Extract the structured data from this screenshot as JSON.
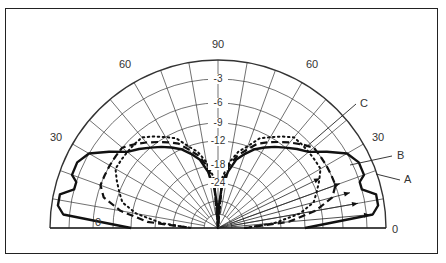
{
  "chart_data": {
    "type": "polar",
    "title": "",
    "subtitle": "",
    "angular_axis": {
      "unit": "degrees (elevation)",
      "range": [
        0,
        180
      ],
      "tick_labels": [
        {
          "angle": 0,
          "label": "0",
          "side": "left"
        },
        {
          "angle": 30,
          "label": "30",
          "side": "left"
        },
        {
          "angle": 60,
          "label": "60",
          "side": "left"
        },
        {
          "angle": 90,
          "label": "90"
        },
        {
          "angle": 60,
          "label": "60",
          "side": "right"
        },
        {
          "angle": 30,
          "label": "30",
          "side": "right"
        },
        {
          "angle": 0,
          "label": "0",
          "side": "right"
        }
      ],
      "gridline_step_deg": 10
    },
    "radial_axis": {
      "unit": "dB",
      "tick_labels": [
        "-3",
        "-6",
        "-9",
        "-12",
        "-18",
        "-24"
      ],
      "tick_values": [
        -3,
        -6,
        -9,
        -12,
        -18,
        -24
      ],
      "range": [
        -40,
        0
      ],
      "grid": true
    },
    "series": [
      {
        "name": "A",
        "style": "solid-thick",
        "angles_deg": [
          0,
          5,
          8,
          12,
          15,
          18,
          20,
          25,
          30,
          35,
          40,
          45,
          50,
          55,
          60,
          65,
          70,
          75,
          80,
          85,
          88,
          90
        ],
        "values_db": [
          -12,
          -2,
          -1,
          -1,
          -3,
          -3,
          -2,
          -2,
          -3,
          -5,
          -7,
          -8,
          -9,
          -10,
          -11,
          -12,
          -14,
          -16,
          -20,
          -26,
          -32,
          -40
        ]
      },
      {
        "name": "B",
        "style": "dashed",
        "angles_deg": [
          0,
          5,
          10,
          15,
          20,
          25,
          30,
          35,
          40,
          45,
          50,
          55,
          60,
          65,
          70,
          75,
          80,
          85,
          90
        ],
        "values_db": [
          -30,
          -16,
          -10,
          -7,
          -6,
          -6,
          -6,
          -6,
          -6,
          -7,
          -8,
          -9,
          -10,
          -11,
          -13,
          -15,
          -18,
          -24,
          -40
        ]
      },
      {
        "name": "C",
        "style": "dotted",
        "angles_deg": [
          0,
          5,
          10,
          15,
          20,
          25,
          30,
          35,
          40,
          45,
          50,
          55,
          60,
          65,
          70,
          75,
          80,
          85,
          90
        ],
        "values_db": [
          -30,
          -20,
          -13,
          -10,
          -9,
          -8,
          -7,
          -7,
          -7,
          -7,
          -7,
          -8,
          -9,
          -10,
          -12,
          -14,
          -17,
          -22,
          -40
        ]
      }
    ],
    "annotations": [
      {
        "label": "A",
        "points_to": "solid curve"
      },
      {
        "label": "B",
        "points_to": "dashed curve"
      },
      {
        "label": "C",
        "points_to": "dotted curve"
      }
    ],
    "legend": {
      "position": "right, as callout labels"
    },
    "grid": true,
    "symmetric": true
  }
}
